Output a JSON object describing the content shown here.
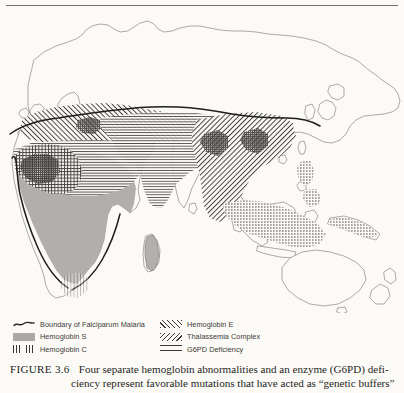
{
  "figure": {
    "label": "FIGURE 3.6",
    "caption_line1": "Four separate hemoglobin abnormalities and an enzyme (G6PD) defi-",
    "caption_line2": "ciency represent favorable mutations that have acted as “genetic buffers”"
  },
  "legend": {
    "left_column": [
      {
        "label": "Boundary of Falciparum Malaria",
        "pattern": "wavy-line",
        "swatch_class": "sw-boundary",
        "icon": "wavy-line-icon"
      },
      {
        "label": "Hemoglobin S",
        "pattern": "solid-gray",
        "swatch_class": "sw-gray",
        "icon": "solid-fill-icon"
      },
      {
        "label": "Hemoglobin C",
        "pattern": "vertical-hatch",
        "swatch_class": "sw-vert",
        "icon": "vertical-hatch-icon"
      }
    ],
    "right_column": [
      {
        "label": "Hemoglobin E",
        "pattern": "diagonal-forward-hatch",
        "swatch_class": "sw-diag-fwd",
        "icon": "forward-diagonal-hatch-icon"
      },
      {
        "label": "Thalassemia Complex",
        "pattern": "diagonal-backward-hatch",
        "swatch_class": "sw-diag-back",
        "icon": "backward-diagonal-hatch-icon"
      },
      {
        "label": "G6PD Deficiency",
        "pattern": "horizontal-hatch",
        "swatch_class": "sw-horiz",
        "icon": "horizontal-hatch-icon"
      }
    ]
  },
  "map": {
    "title": "Old World distribution of hemoglobin abnormalities and G6PD deficiency",
    "projection_extent": "Europe, Africa, Asia, Australia",
    "background_color": "#fbfaf7",
    "coastline_color": "#6e6c68",
    "hatch_color": "#3b3936",
    "hemoglobin_s_fill": "#a9a8a4",
    "regions": [
      {
        "name": "Sub-Saharan Africa",
        "pattern": "solid-gray",
        "trait": "Hemoglobin S"
      },
      {
        "name": "West Africa",
        "pattern": "vertical-hatch",
        "trait": "Hemoglobin C"
      },
      {
        "name": "Mediterranean basin and Middle East",
        "pattern": "diagonal-backward-hatch",
        "trait": "Thalassemia Complex"
      },
      {
        "name": "North Africa, Arabia, South Asia",
        "pattern": "horizontal-hatch",
        "trait": "G6PD Deficiency"
      },
      {
        "name": "Southeast Asia and Indonesia",
        "pattern": "diagonal-forward-hatch",
        "trait": "Hemoglobin E"
      },
      {
        "name": "Australia and New Zealand",
        "pattern": "none",
        "trait": "none"
      }
    ]
  }
}
